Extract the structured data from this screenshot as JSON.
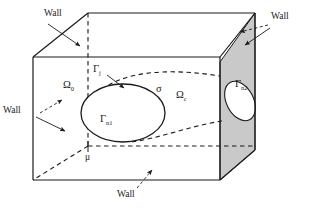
{
  "figure": {
    "type": "3d-domain-diagram",
    "colors": {
      "line": "#1a1a1a",
      "shaded_face": "#c9c9c9",
      "background": "#ffffff",
      "text": "#1a1a1a"
    },
    "labels": {
      "wall_top_left": "Wall",
      "wall_top_right": "Wall",
      "wall_left": "Wall",
      "wall_bottom": "Wall",
      "omega_0": "Ω",
      "omega_0_sub": "0",
      "omega_c": "Ω",
      "omega_c_sub": "c",
      "sigma": "σ",
      "gamma_j": "Γ",
      "gamma_j_sub": "j",
      "gamma_n1": "Γ",
      "gamma_n1_sub": "n1",
      "gamma_n2": "Γ",
      "gamma_n2_sub": "n2",
      "mu": "μ"
    }
  }
}
